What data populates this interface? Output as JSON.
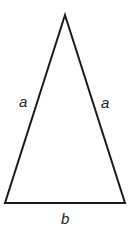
{
  "diagram": {
    "stroke_color": "#1a1a1a",
    "vertices": {
      "apex": [
        65,
        15
      ],
      "bottom_left": [
        5,
        203
      ],
      "bottom_right": [
        125,
        203
      ]
    },
    "labels": {
      "left_side": "a",
      "right_side": "a",
      "base": "b"
    }
  }
}
